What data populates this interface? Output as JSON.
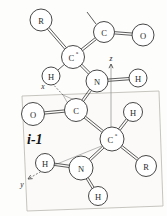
{
  "figure": {
    "residue_label": "i-1",
    "plane_label": "peptide-plane",
    "background_color": "#fdfdfc",
    "bond_color": "#4a4a4a",
    "atom_fill": "#ffffff",
    "atom_stroke": "#3d3d3d",
    "plane_fill": "#fbfaf8",
    "plane_stroke": "#b9b6ae"
  },
  "axes": [
    {
      "id": "x",
      "label": "x",
      "label_x": 43,
      "label_y": 86,
      "tip_x": 49,
      "tip_y": 80,
      "tail_x": 63,
      "tail_y": 95
    },
    {
      "id": "y",
      "label": "y",
      "label_x": 22,
      "label_y": 184,
      "tip_x": 28,
      "tip_y": 179,
      "tail_x": 47,
      "tail_y": 168
    },
    {
      "id": "z",
      "label": "z",
      "label_x": 111,
      "label_y": 58,
      "tip_x": 111,
      "tip_y": 64,
      "tail_x": 111,
      "tail_y": 135
    }
  ],
  "atoms": [
    {
      "id": "a1",
      "label": "R",
      "sup": "",
      "cx": 41,
      "cy": 20,
      "r": 11.0,
      "name": "atom-r-upper"
    },
    {
      "id": "a2",
      "label": "C",
      "sup": "",
      "cx": 104,
      "cy": 32,
      "r": 10.5,
      "name": "atom-c-carbonyl-upper"
    },
    {
      "id": "a3",
      "label": "O",
      "sup": "",
      "cx": 143,
      "cy": 35,
      "r": 11.0,
      "name": "atom-o-upper"
    },
    {
      "id": "a4",
      "label": "C",
      "sup": "a",
      "cx": 73,
      "cy": 57,
      "r": 11.5,
      "name": "atom-c-alpha-upper"
    },
    {
      "id": "a5",
      "label": "H",
      "sup": "",
      "cx": 51,
      "cy": 76,
      "r": 9.0,
      "name": "atom-h-alpha-upper"
    },
    {
      "id": "a6",
      "label": "N",
      "sup": "",
      "cx": 97,
      "cy": 81,
      "r": 11.0,
      "name": "atom-n-amide"
    },
    {
      "id": "a7",
      "label": "H",
      "sup": "",
      "cx": 138,
      "cy": 78,
      "r": 9.0,
      "name": "atom-h-amide"
    },
    {
      "id": "a8",
      "label": "O",
      "sup": "",
      "cx": 33,
      "cy": 114,
      "r": 11.5,
      "name": "atom-o-carbonyl"
    },
    {
      "id": "a9",
      "label": "C",
      "sup": "",
      "cx": 76,
      "cy": 110,
      "r": 11.5,
      "name": "atom-c-carbonyl"
    },
    {
      "id": "a10",
      "label": "C",
      "sup": "a",
      "cx": 112,
      "cy": 139,
      "r": 12.0,
      "name": "atom-c-alpha-lower"
    },
    {
      "id": "a11",
      "label": "H",
      "sup": "",
      "cx": 133,
      "cy": 112,
      "r": 9.5,
      "name": "atom-h-alpha-lower"
    },
    {
      "id": "a12",
      "label": "R",
      "sup": "",
      "cx": 146,
      "cy": 166,
      "r": 10.5,
      "name": "atom-r-lower"
    },
    {
      "id": "a13",
      "label": "N",
      "sup": "",
      "cx": 81,
      "cy": 168,
      "r": 12.0,
      "name": "atom-n-amine"
    },
    {
      "id": "a14",
      "label": "H",
      "sup": "",
      "cx": 45,
      "cy": 163,
      "r": 9.5,
      "name": "atom-h-amine-left"
    },
    {
      "id": "a15",
      "label": "H",
      "sup": "",
      "cx": 98,
      "cy": 196,
      "r": 9.5,
      "name": "atom-h-amine-bottom"
    }
  ],
  "bonds": [
    {
      "from": "a1",
      "to": "a4",
      "order": 2,
      "name": "bond-r-calpha-upper"
    },
    {
      "from": "a4",
      "to": "a2",
      "order": 2,
      "name": "bond-calpha-c-upper"
    },
    {
      "from": "a2",
      "to": "a3",
      "order": 2,
      "name": "bond-c-o-upper"
    },
    {
      "from": "a4",
      "to": "a5",
      "order": 1,
      "name": "bond-calpha-h-upper"
    },
    {
      "from": "a4",
      "to": "a6",
      "order": 2,
      "name": "bond-calpha-n-upper"
    },
    {
      "from": "a6",
      "to": "a7",
      "order": 2,
      "name": "bond-n-h-amide"
    },
    {
      "from": "a6",
      "to": "a9",
      "order": 2,
      "name": "bond-n-c-peptide"
    },
    {
      "from": "a9",
      "to": "a8",
      "order": 2,
      "name": "bond-c-o-carbonyl"
    },
    {
      "from": "a9",
      "to": "a10",
      "order": 2,
      "name": "bond-c-calpha-lower"
    },
    {
      "from": "a10",
      "to": "a11",
      "order": 2,
      "name": "bond-calpha-h-lower"
    },
    {
      "from": "a10",
      "to": "a12",
      "order": 2,
      "name": "bond-calpha-r-lower"
    },
    {
      "from": "a10",
      "to": "a13",
      "order": 2,
      "name": "bond-calpha-n-amine"
    },
    {
      "from": "a13",
      "to": "a14",
      "order": 2,
      "name": "bond-n-h-left"
    },
    {
      "from": "a13",
      "to": "a15",
      "order": 2,
      "name": "bond-n-h-bottom"
    }
  ],
  "stub_bonds": [
    {
      "x1": 96,
      "y1": 24,
      "x2": 87,
      "y2": 12,
      "name": "bond-stub-next-residue"
    }
  ],
  "plane_points": "22,96 159,91 163,206 27,211",
  "guide_lines": [
    {
      "x1": 63,
      "y1": 95,
      "x2": 86,
      "y2": 105,
      "name": "guide-x-to-carbonyl"
    },
    {
      "x1": 63,
      "y1": 95,
      "x2": 78,
      "y2": 121,
      "name": "guide-x-to-calpha"
    },
    {
      "x1": 47,
      "y1": 168,
      "x2": 104,
      "y2": 145,
      "name": "guide-y-to-calpha"
    }
  ]
}
